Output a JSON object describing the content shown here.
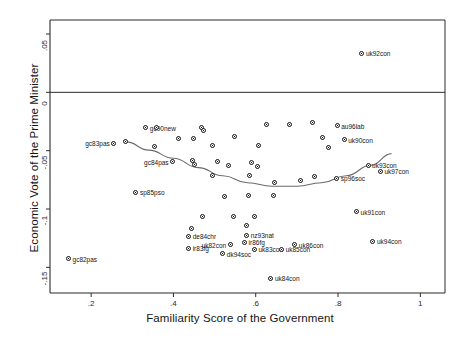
{
  "chart_data": {
    "type": "scatter",
    "title": "",
    "xlabel": "Familiarity Score of the Government",
    "ylabel": "Economic Vote of the Prime Minister",
    "xlim": [
      0.1,
      1.06
    ],
    "ylim": [
      -0.172,
      0.062
    ],
    "xticks": [
      ".2",
      ".4",
      ".6",
      ".8",
      "1"
    ],
    "xtickvalues": [
      0.2,
      0.4,
      0.6,
      0.8,
      1.0
    ],
    "yticks": [
      ".05",
      "0",
      "-.05",
      "-.1",
      "-.15"
    ],
    "ytickvalues": [
      0.05,
      0,
      -0.05,
      -0.1,
      -0.15
    ],
    "grid": false,
    "legend": null,
    "reference_lines": [
      {
        "axis": "y",
        "value": 0
      }
    ],
    "fit_line": {
      "type": "quadratic-lowess",
      "description": "U-shaped fitted curve through the point cloud",
      "color": "#6b6b6b",
      "points": [
        [
          0.285,
          -0.0425
        ],
        [
          0.34,
          -0.0495
        ],
        [
          0.4,
          -0.0565
        ],
        [
          0.46,
          -0.0645
        ],
        [
          0.52,
          -0.0715
        ],
        [
          0.58,
          -0.0775
        ],
        [
          0.64,
          -0.0805
        ],
        [
          0.7,
          -0.0805
        ],
        [
          0.76,
          -0.0775
        ],
        [
          0.82,
          -0.0715
        ],
        [
          0.88,
          -0.0625
        ],
        [
          0.93,
          -0.0525
        ]
      ]
    },
    "points": [
      {
        "label": "uk92con",
        "x": 0.858,
        "y": 0.0335,
        "labelside": "right"
      },
      {
        "label": "au96lab",
        "x": 0.798,
        "y": -0.0285,
        "labelside": "right"
      },
      {
        "label": "gc90new",
        "x": 0.333,
        "y": -0.0305,
        "labelside": "right"
      },
      {
        "label": "uk90con",
        "x": 0.815,
        "y": -0.0405,
        "labelside": "right"
      },
      {
        "label": "gc83pas",
        "x": 0.255,
        "y": -0.0435,
        "labelside": "left"
      },
      {
        "label": "gc84pas",
        "x": 0.398,
        "y": -0.0595,
        "labelside": "left"
      },
      {
        "label": "uk93con",
        "x": 0.873,
        "y": -0.0625,
        "labelside": "right"
      },
      {
        "label": "uk97con",
        "x": 0.903,
        "y": -0.0675,
        "labelside": "right"
      },
      {
        "label": "sp96soc",
        "x": 0.797,
        "y": -0.0735,
        "labelside": "right"
      },
      {
        "label": "sp85pso",
        "x": 0.309,
        "y": -0.0855,
        "labelside": "right"
      },
      {
        "label": "uk91con",
        "x": 0.845,
        "y": -0.1025,
        "labelside": "right"
      },
      {
        "label": "de84chr",
        "x": 0.437,
        "y": -0.1235,
        "labelside": "right"
      },
      {
        "label": "nz93nat",
        "x": 0.578,
        "y": -0.1225,
        "labelside": "right"
      },
      {
        "label": "ir86fg",
        "x": 0.573,
        "y": -0.1285,
        "labelside": "right"
      },
      {
        "label": "uk82con",
        "x": 0.538,
        "y": -0.1305,
        "labelside": "left"
      },
      {
        "label": "ir83fg",
        "x": 0.437,
        "y": -0.1335,
        "labelside": "right"
      },
      {
        "label": "uk94con",
        "x": 0.885,
        "y": -0.1275,
        "labelside": "right"
      },
      {
        "label": "uk83con",
        "x": 0.597,
        "y": -0.1345,
        "labelside": "right"
      },
      {
        "label": "uk85con",
        "x": 0.663,
        "y": -0.1345,
        "labelside": "right"
      },
      {
        "label": "uk86con",
        "x": 0.695,
        "y": -0.1305,
        "labelside": "right"
      },
      {
        "label": "dk94soc",
        "x": 0.52,
        "y": -0.1385,
        "labelside": "right"
      },
      {
        "label": "uk84con",
        "x": 0.637,
        "y": -0.1595,
        "labelside": "right"
      },
      {
        "label": "",
        "x": 0.359,
        "y": -0.0305,
        "labelside": "right"
      },
      {
        "label": "",
        "x": 0.468,
        "y": -0.0305,
        "labelside": "right"
      },
      {
        "label": "",
        "x": 0.474,
        "y": -0.0325,
        "labelside": "right"
      },
      {
        "label": "",
        "x": 0.627,
        "y": -0.0275,
        "labelside": "right"
      },
      {
        "label": "",
        "x": 0.683,
        "y": -0.0275,
        "labelside": "right"
      },
      {
        "label": "",
        "x": 0.738,
        "y": -0.0255,
        "labelside": "right"
      },
      {
        "label": "",
        "x": 0.413,
        "y": -0.0395,
        "labelside": "right"
      },
      {
        "label": "",
        "x": 0.448,
        "y": -0.0395,
        "labelside": "right"
      },
      {
        "label": "",
        "x": 0.549,
        "y": -0.0375,
        "labelside": "right"
      },
      {
        "label": "",
        "x": 0.762,
        "y": -0.0385,
        "labelside": "right"
      },
      {
        "label": "",
        "x": 0.353,
        "y": -0.0465,
        "labelside": "right"
      },
      {
        "label": "",
        "x": 0.494,
        "y": -0.0455,
        "labelside": "right"
      },
      {
        "label": "",
        "x": 0.606,
        "y": -0.0455,
        "labelside": "right"
      },
      {
        "label": "",
        "x": 0.778,
        "y": -0.0475,
        "labelside": "right"
      },
      {
        "label": "",
        "x": 0.446,
        "y": -0.0585,
        "labelside": "right"
      },
      {
        "label": "",
        "x": 0.45,
        "y": -0.0615,
        "labelside": "right"
      },
      {
        "label": "",
        "x": 0.508,
        "y": -0.0595,
        "labelside": "right"
      },
      {
        "label": "",
        "x": 0.535,
        "y": -0.0625,
        "labelside": "right"
      },
      {
        "label": "",
        "x": 0.589,
        "y": -0.0605,
        "labelside": "right"
      },
      {
        "label": "",
        "x": 0.604,
        "y": -0.0635,
        "labelside": "right"
      },
      {
        "label": "",
        "x": 0.494,
        "y": -0.0715,
        "labelside": "right"
      },
      {
        "label": "",
        "x": 0.585,
        "y": -0.0715,
        "labelside": "right"
      },
      {
        "label": "",
        "x": 0.645,
        "y": -0.0775,
        "labelside": "right"
      },
      {
        "label": "",
        "x": 0.708,
        "y": -0.0755,
        "labelside": "right"
      },
      {
        "label": "",
        "x": 0.743,
        "y": -0.0725,
        "labelside": "right"
      },
      {
        "label": "",
        "x": 0.525,
        "y": -0.0895,
        "labelside": "right"
      },
      {
        "label": "",
        "x": 0.583,
        "y": -0.0885,
        "labelside": "right"
      },
      {
        "label": "",
        "x": 0.642,
        "y": -0.0885,
        "labelside": "right"
      },
      {
        "label": "",
        "x": 0.47,
        "y": -0.1065,
        "labelside": "right"
      },
      {
        "label": "",
        "x": 0.545,
        "y": -0.1065,
        "labelside": "right"
      },
      {
        "label": "",
        "x": 0.597,
        "y": -0.1065,
        "labelside": "right"
      },
      {
        "label": "",
        "x": 0.578,
        "y": -0.1145,
        "labelside": "right"
      },
      {
        "label": "",
        "x": 0.443,
        "y": -0.1165,
        "labelside": "right"
      },
      {
        "label": "",
        "x": 0.145,
        "y": -0.1425,
        "labelside": "right"
      },
      {
        "label": "",
        "x": 0.283,
        "y": -0.0425,
        "labelside": "right"
      }
    ],
    "named_point_override": [
      {
        "label": "gc82pas",
        "x": 0.145,
        "y": -0.1425,
        "labelside": "right"
      }
    ]
  }
}
